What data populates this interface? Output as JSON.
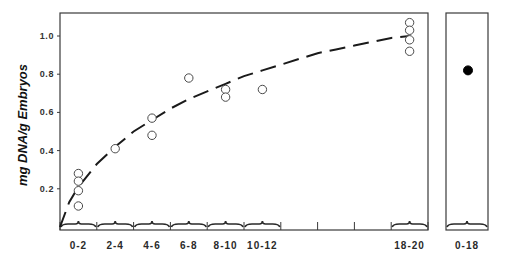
{
  "chart_data": [
    {
      "type": "scatter",
      "panel": "main",
      "title": "",
      "xlabel": "",
      "ylabel": "mg DNA/g Embryos",
      "ylim": [
        0,
        1.1
      ],
      "yticks": [
        0.2,
        0.4,
        0.6,
        0.8,
        1.0
      ],
      "ytick_labels": [
        "0.2",
        "0.4",
        "0.6",
        "0.8",
        "1.0"
      ],
      "x_range_hours": [
        0,
        20
      ],
      "x_tick_hours": [
        0,
        2,
        4,
        6,
        8,
        10,
        12,
        14,
        16,
        18,
        20
      ],
      "categories": [
        "0-2",
        "2-4",
        "4-6",
        "6-8",
        "8-10",
        "10-12",
        "18-20"
      ],
      "grid": false,
      "legend": null,
      "series": [
        {
          "name": "individual measurements",
          "marker": "open-circle",
          "points": [
            {
              "category": "0-2",
              "x": 1,
              "y": 0.28
            },
            {
              "category": "0-2",
              "x": 1,
              "y": 0.24
            },
            {
              "category": "0-2",
              "x": 1,
              "y": 0.19
            },
            {
              "category": "0-2",
              "x": 1,
              "y": 0.11
            },
            {
              "category": "2-4",
              "x": 3,
              "y": 0.41
            },
            {
              "category": "4-6",
              "x": 5,
              "y": 0.57
            },
            {
              "category": "4-6",
              "x": 5,
              "y": 0.48
            },
            {
              "category": "6-8",
              "x": 7,
              "y": 0.78
            },
            {
              "category": "8-10",
              "x": 9,
              "y": 0.72
            },
            {
              "category": "8-10",
              "x": 9,
              "y": 0.68
            },
            {
              "category": "10-12",
              "x": 11,
              "y": 0.72
            },
            {
              "category": "18-20",
              "x": 19,
              "y": 1.07
            },
            {
              "category": "18-20",
              "x": 19,
              "y": 1.03
            },
            {
              "category": "18-20",
              "x": 19,
              "y": 0.98
            },
            {
              "category": "18-20",
              "x": 19,
              "y": 0.92
            }
          ]
        },
        {
          "name": "fitted curve",
          "style": "dashed-line",
          "x": [
            0,
            0.5,
            1,
            2,
            3,
            4,
            5,
            6,
            7,
            8,
            9,
            10,
            11,
            12,
            13,
            14,
            15,
            16,
            17,
            18,
            19
          ],
          "y": [
            0.0,
            0.13,
            0.21,
            0.33,
            0.42,
            0.5,
            0.56,
            0.62,
            0.67,
            0.71,
            0.75,
            0.79,
            0.82,
            0.85,
            0.88,
            0.91,
            0.93,
            0.95,
            0.97,
            0.99,
            1.0
          ]
        }
      ]
    },
    {
      "type": "scatter",
      "panel": "side",
      "title": "",
      "categories": [
        "0-18"
      ],
      "ylim": [
        0,
        1.1
      ],
      "series": [
        {
          "name": "pooled 0-18",
          "marker": "filled-circle",
          "points": [
            {
              "category": "0-18",
              "y": 0.82
            }
          ]
        }
      ]
    }
  ]
}
